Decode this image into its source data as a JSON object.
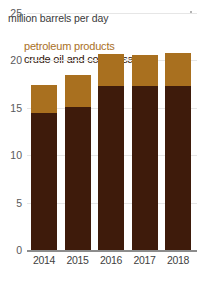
{
  "chart_data": {
    "type": "bar",
    "title": "million barrels per day",
    "subtitle": "",
    "xlabel": "",
    "ylabel": "million barrels per day",
    "categories": [
      "2014",
      "2015",
      "2016",
      "2017",
      "2018"
    ],
    "series": [
      {
        "name": "crude oil and condensate",
        "color": "#3e1b0b",
        "values": [
          14.4,
          15.1,
          17.3,
          17.3,
          17.3
        ]
      },
      {
        "name": "petroleum products",
        "color": "#a9701f",
        "values": [
          3.0,
          3.3,
          3.3,
          3.2,
          3.4
        ]
      }
    ],
    "totals": [
      17.4,
      18.4,
      20.6,
      20.5,
      20.7
    ],
    "stacked": true,
    "ylim": [
      0,
      25
    ],
    "yticks": [
      0,
      5,
      10,
      15,
      20,
      25
    ],
    "ytick_labels": [
      "0",
      "5",
      "10",
      "15",
      "20",
      "25"
    ],
    "grid": true,
    "legend_position": "top-left"
  },
  "legend": {
    "products_label": "petroleum products",
    "crude_label": "crude oil and condensate",
    "products_color": "#a9701f",
    "crude_color": "#3e1b0b"
  },
  "axis": {
    "y_labels": [
      "25",
      "20",
      "15",
      "10",
      "5",
      "0"
    ],
    "x_labels": [
      "2014",
      "2015",
      "2016",
      "2017",
      "2018"
    ]
  }
}
